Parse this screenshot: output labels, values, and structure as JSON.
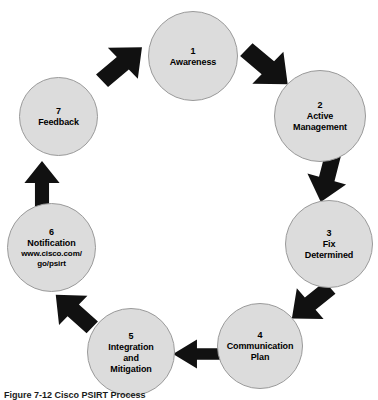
{
  "figure": {
    "caption": "Figure 7-12  Cisco PSIRT Process",
    "background_color": "#ffffff",
    "node_fill_color": "#dcdcdc",
    "node_border_color": "#9a9a9a",
    "arrow_color": "#111111",
    "text_color": "#000000"
  },
  "chart_data": {
    "type": "diagram",
    "title": "Figure 7-12  Cisco PSIRT Process",
    "layout": "clockwise-cycle",
    "node_count": 7,
    "arrow_count": 7
  },
  "nodes": [
    {
      "id": "awareness",
      "number": "1",
      "label": "Awareness",
      "sub": "",
      "x": 148,
      "y": 11,
      "size": 90
    },
    {
      "id": "active-management",
      "number": "2",
      "label": "Active\nManagement",
      "sub": "",
      "x": 274,
      "y": 70,
      "size": 92
    },
    {
      "id": "fix-determined",
      "number": "3",
      "label": "Fix\nDetermined",
      "sub": "",
      "x": 285,
      "y": 200,
      "size": 88
    },
    {
      "id": "communication-plan",
      "number": "4",
      "label": "Communication\nPlan",
      "sub": "",
      "x": 217,
      "y": 303,
      "size": 86
    },
    {
      "id": "integration-and-mitigation",
      "number": "5",
      "label": "Integration\nand\nMitigation",
      "sub": "",
      "x": 87,
      "y": 308,
      "size": 88
    },
    {
      "id": "notification",
      "number": "6",
      "label": "Notification",
      "sub": "www.cisco.com/\ngo/psirt",
      "x": 7,
      "y": 203,
      "size": 89
    },
    {
      "id": "feedback",
      "number": "7",
      "label": "Feedback",
      "sub": "",
      "x": 19,
      "y": 77,
      "size": 79
    }
  ],
  "arrows": [
    {
      "id": "feedback-to-awareness",
      "from": "feedback",
      "to": "awareness",
      "direction": "north-east",
      "x": 94,
      "y": 38,
      "w": 56,
      "h": 52,
      "rotate": -42
    },
    {
      "id": "awareness-to-active-management",
      "from": "awareness",
      "to": "active-management",
      "direction": "south-east",
      "x": 238,
      "y": 40,
      "w": 58,
      "h": 54,
      "rotate": 42
    },
    {
      "id": "active-management-to-fix-determined",
      "from": "active-management",
      "to": "fix-determined",
      "direction": "south",
      "x": 302,
      "y": 152,
      "w": 50,
      "h": 52,
      "rotate": 105
    },
    {
      "id": "fix-determined-to-communication-plan",
      "from": "fix-determined",
      "to": "communication-plan",
      "direction": "south-west",
      "x": 285,
      "y": 278,
      "w": 52,
      "h": 50,
      "rotate": 140
    },
    {
      "id": "communication-plan-to-integration",
      "from": "communication-plan",
      "to": "integration-and-mitigation",
      "direction": "west",
      "x": 172,
      "y": 336,
      "w": 52,
      "h": 36,
      "rotate": 180
    },
    {
      "id": "integration-to-notification",
      "from": "integration-and-mitigation",
      "to": "notification",
      "direction": "north-west",
      "x": 48,
      "y": 286,
      "w": 52,
      "h": 50,
      "rotate": -137
    },
    {
      "id": "notification-to-feedback",
      "from": "notification",
      "to": "feedback",
      "direction": "north",
      "x": 20,
      "y": 160,
      "w": 44,
      "h": 48,
      "rotate": -90
    }
  ]
}
